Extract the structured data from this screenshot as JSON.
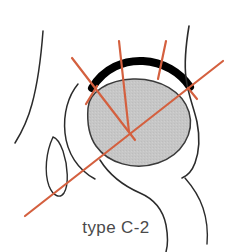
{
  "figure": {
    "caption": "type C-2",
    "classification_label": "type C-2",
    "modality": "hip ultrasound schematic",
    "colors": {
      "measurement_line": "#d4603f",
      "bony_roof": "#000000",
      "femoral_head_fill": "#c6c6c6",
      "femoral_head_stroke": "#3a3a3a",
      "soft_tissue_outline": "#2b2b2b",
      "background": "#ffffff",
      "caption_color": "#4a4a4a"
    },
    "structures": [
      {
        "name": "skin-contour-left",
        "kind": "outline"
      },
      {
        "name": "skin-contour-right",
        "kind": "outline"
      },
      {
        "name": "bony-roof-arc",
        "kind": "echogenic-bone"
      },
      {
        "name": "femoral-head",
        "kind": "cartilage-sphere"
      },
      {
        "name": "labrum-teardrop",
        "kind": "cartilage"
      },
      {
        "name": "joint-capsule-curve",
        "kind": "outline"
      },
      {
        "name": "lower-soft-tissue-curve",
        "kind": "outline"
      }
    ],
    "measurement_lines": [
      {
        "name": "baseline",
        "label": "baseline",
        "kind": "long-diagonal"
      },
      {
        "name": "bony-roof-line",
        "label": "bony roof line",
        "kind": "long-diagonal"
      },
      {
        "name": "inclination-line",
        "label": "cartilage roof line",
        "kind": "short-vertical"
      },
      {
        "name": "marker-tick-left",
        "label": "tick",
        "kind": "short-tick"
      },
      {
        "name": "marker-tick-center",
        "label": "tick",
        "kind": "short-tick"
      },
      {
        "name": "marker-tick-right",
        "label": "tick",
        "kind": "short-tick"
      }
    ]
  }
}
